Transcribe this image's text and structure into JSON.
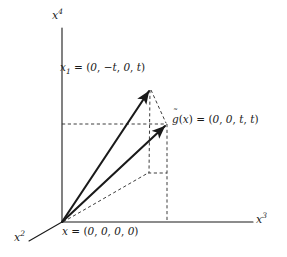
{
  "figure": {
    "name": "four-dimensional-vector-diagram",
    "background_color": "#ffffff",
    "stroke_color": "#1a1a1a",
    "axes": [
      {
        "id": "x4",
        "label_base": "x",
        "label_sup": "4",
        "orientation": "vertical-up"
      },
      {
        "id": "x3",
        "label_base": "x",
        "label_sup": "3",
        "orientation": "horizontal-right"
      },
      {
        "id": "x2",
        "label_base": "x",
        "label_sup": "2",
        "orientation": "diagonal-down-left"
      }
    ],
    "labels": {
      "axis_x4": {
        "base": "x",
        "sup": "4"
      },
      "axis_x3": {
        "base": "x",
        "sup": "3"
      },
      "axis_x2": {
        "base": "x",
        "sup": "2"
      },
      "point_x1": {
        "symbol": "x",
        "subscript": "1",
        "equals": "=",
        "open": "(",
        "components": [
          "0",
          "−t",
          "0",
          "t"
        ],
        "separator": ",",
        "close": ")",
        "full_text": "x₁ = (0, −t, 0, t)"
      },
      "point_gtilde": {
        "symbol": "g",
        "accent": "˜",
        "argument_open": "(",
        "argument": "x",
        "argument_close": ")",
        "equals": "=",
        "open": "(",
        "components": [
          "0",
          "0",
          "t",
          "t"
        ],
        "separator": ",",
        "close": ")",
        "full_text": "g̃(x) = (0, 0, t, t)"
      },
      "point_origin": {
        "symbol": "x",
        "equals": "=",
        "open": "(",
        "components": [
          "0",
          "0",
          "0",
          "0"
        ],
        "separator": ",",
        "close": ")",
        "full_text": "x = (0, 0, 0, 0)"
      }
    },
    "geometry": {
      "origin": {
        "x": 62,
        "y": 222
      },
      "point_x1": {
        "x": 150,
        "y": 88
      },
      "point_gtilde": {
        "x": 167,
        "y": 124
      },
      "x4_axis_top": {
        "x": 62,
        "y": 28
      },
      "x3_axis_right": {
        "x": 253,
        "y": 222
      },
      "x2_axis_end": {
        "x": 29,
        "y": 241
      },
      "projection_corner": {
        "x": 148,
        "y": 173
      },
      "gtilde_foot": {
        "x": 167,
        "y": 222
      },
      "height_line_left": {
        "x": 62,
        "y": 124
      }
    },
    "solid_vectors": [
      {
        "name": "vector-to-x1",
        "from": "origin",
        "to": "point_x1"
      },
      {
        "name": "vector-to-gtilde",
        "from": "origin",
        "to": "point_gtilde"
      }
    ],
    "dashed_lines": [
      {
        "name": "height-guide-horizontal",
        "from": "height_line_left",
        "to": "point_gtilde"
      },
      {
        "name": "gtilde-drop-vertical",
        "from": "point_gtilde",
        "to": "gtilde_foot"
      },
      {
        "name": "x1-drop-vertical",
        "from": "point_x1",
        "to": "projection_corner"
      },
      {
        "name": "x1-to-gtilde-diagonal",
        "from": "point_x1",
        "to": "point_gtilde"
      },
      {
        "name": "base-projection-diagonal",
        "from": "origin",
        "to": "projection_corner"
      },
      {
        "name": "projection-connector",
        "from": "projection_corner",
        "to": "gtilde_foot"
      }
    ]
  }
}
